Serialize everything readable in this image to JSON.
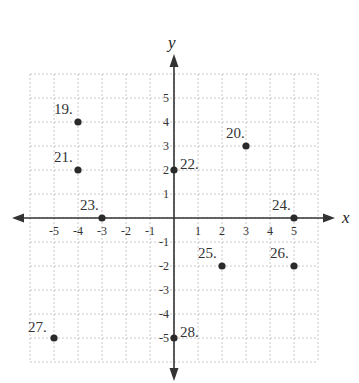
{
  "chart_data": {
    "type": "scatter",
    "title": "",
    "xlabel": "x",
    "ylabel": "y",
    "xlim": [
      -6,
      6
    ],
    "ylim": [
      -6,
      6
    ],
    "grid": true,
    "x_ticks": [
      -5,
      -4,
      -3,
      -2,
      -1,
      1,
      2,
      3,
      4,
      5
    ],
    "y_ticks": [
      -5,
      -4,
      -3,
      -2,
      -1,
      1,
      2,
      3,
      4,
      5
    ],
    "points": [
      {
        "label": "19.",
        "x": -4,
        "y": 4
      },
      {
        "label": "20.",
        "x": 3,
        "y": 3
      },
      {
        "label": "21.",
        "x": -4,
        "y": 2
      },
      {
        "label": "22.",
        "x": 0,
        "y": 2
      },
      {
        "label": "23.",
        "x": -3,
        "y": 0
      },
      {
        "label": "24.",
        "x": 5,
        "y": 0
      },
      {
        "label": "25.",
        "x": 2,
        "y": -2
      },
      {
        "label": "26.",
        "x": 5,
        "y": -2
      },
      {
        "label": "27.",
        "x": -5,
        "y": -5
      },
      {
        "label": "28.",
        "x": 0,
        "y": -5
      }
    ]
  },
  "colors": {
    "axis": "#333333",
    "grid": "#c8c8c8",
    "point": "#2a2a2a",
    "text": "#333333"
  }
}
